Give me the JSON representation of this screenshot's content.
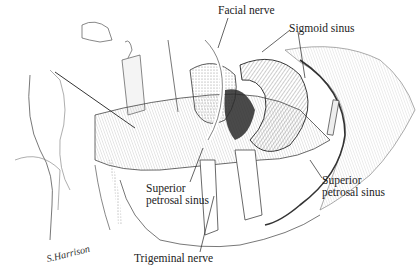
{
  "figure": {
    "type": "surgical anatomical illustration",
    "signature": "S.Harrison",
    "labels": [
      {
        "id": "facial-nerve",
        "text": "Facial nerve",
        "x": 218,
        "y": 4
      },
      {
        "id": "sigmoid-sinus",
        "text": "Sigmoid sinus",
        "x": 289,
        "y": 22
      },
      {
        "id": "superior-petrosal-sinus-left",
        "line1": "Superior",
        "line2": "petrosal sinus",
        "x": 146,
        "y": 182
      },
      {
        "id": "superior-petrosal-sinus-right",
        "line1": "Superior",
        "line2": "petrosal sinus",
        "x": 322,
        "y": 174
      },
      {
        "id": "trigeminal-nerve",
        "text": "Trigeminal nerve",
        "x": 134,
        "y": 252
      }
    ]
  }
}
